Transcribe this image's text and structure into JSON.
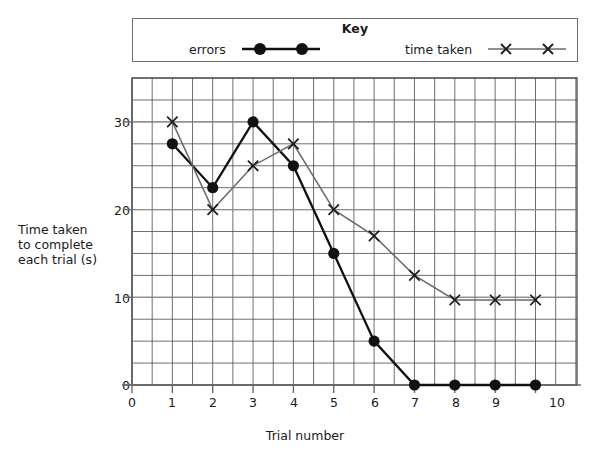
{
  "key": {
    "title": "Key",
    "entries": [
      {
        "label": "errors",
        "marker": "filled-circle-marker",
        "color": "#111111"
      },
      {
        "label": "time taken",
        "marker": "cross-marker",
        "color": "#6b6b6b"
      }
    ]
  },
  "axes": {
    "y_title": "Time taken to complete each trial (s)",
    "x_title": "Trial number",
    "y_ticks": [
      "0",
      "10",
      "20",
      "30"
    ],
    "x_ticks": [
      "0",
      "1",
      "2",
      "3",
      "4",
      "5",
      "6",
      "7",
      "8",
      "9",
      "10"
    ]
  },
  "chart_data": {
    "type": "line",
    "title": "",
    "xlabel": "Trial number",
    "ylabel": "Time taken to complete each trial (s)",
    "x": [
      1,
      2,
      3,
      4,
      5,
      6,
      7,
      8,
      9,
      10
    ],
    "xlim": [
      0,
      10.5
    ],
    "ylim": [
      0,
      35
    ],
    "x_ticks": [
      0,
      1,
      2,
      3,
      4,
      5,
      6,
      7,
      8,
      9,
      10
    ],
    "y_ticks": [
      0,
      10,
      20,
      30
    ],
    "grid": true,
    "grid_minor_x_step": 0.5,
    "grid_minor_y_step": 2.5,
    "legend_position": "top",
    "series": [
      {
        "name": "errors",
        "marker": "filled-circle",
        "color": "#111111",
        "values": [
          27.5,
          22.5,
          30,
          25,
          15,
          5,
          0,
          0,
          0,
          0
        ]
      },
      {
        "name": "time taken",
        "marker": "cross",
        "color": "#6b6b6b",
        "values": [
          30,
          20,
          25,
          27.5,
          20,
          17,
          12.5,
          9.7,
          9.7,
          9.7
        ]
      }
    ]
  }
}
